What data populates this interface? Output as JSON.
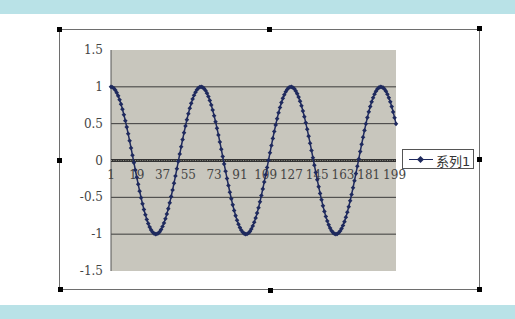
{
  "chart_data": {
    "type": "line",
    "title": "",
    "xlabel": "",
    "ylabel": "",
    "ylim": [
      -1.5,
      1.5
    ],
    "y_ticks": [
      "1.5",
      "1",
      "0.5",
      "0",
      "-0.5",
      "-1",
      "-1.5"
    ],
    "x_tick_labels": [
      "1",
      "19",
      "37",
      "55",
      "73",
      "91",
      "109",
      "127",
      "145",
      "163",
      "181",
      "199"
    ],
    "x_range": [
      1,
      200
    ],
    "grid": true,
    "legend_position": "right",
    "plot_background": "#c8c6bd",
    "series": [
      {
        "name": "系列1",
        "color": "#1f2a5e",
        "marker": "diamond",
        "formula": "cos((n-1)*0.1), n=1..200",
        "x_start": 1,
        "x_step": 1,
        "count": 200,
        "values_description": "cosine wave starting at 1, peaks near points 1, 64, 127, 189; troughs near points 32, 95, 158; ending near 0.48 at point 200"
      }
    ]
  },
  "legend": {
    "label": "系列1"
  },
  "colors": {
    "band": "#b9e2e7",
    "plot_area": "#c8c6bd",
    "series": "#1f2a5e",
    "gridline": "#3a3a3a"
  }
}
